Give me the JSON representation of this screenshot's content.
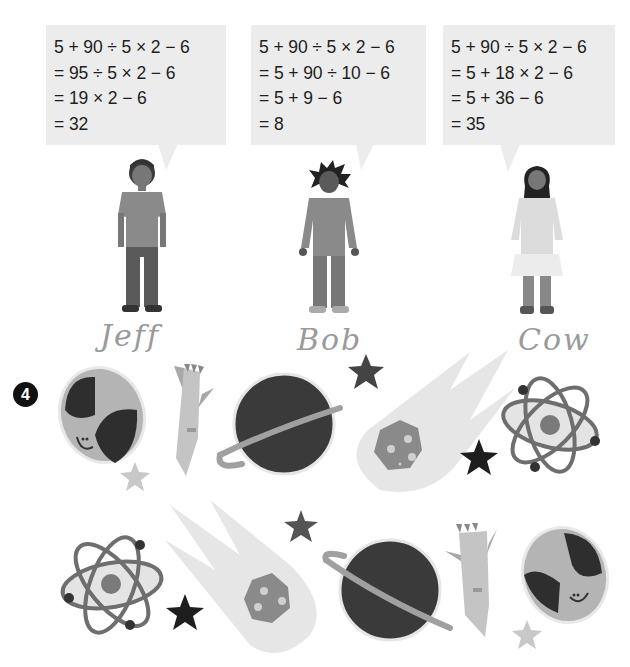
{
  "problem": {
    "expression": "5 + 90 ÷ 5 × 2 − 6"
  },
  "students": [
    {
      "name": "Jeff",
      "signature": "Jeff",
      "work": [
        "5 + 90 ÷ 5 × 2 − 6",
        "= 95 ÷ 5 × 2 − 6",
        "= 19 × 2 − 6",
        "= 32"
      ]
    },
    {
      "name": "Bob",
      "signature": "Bob",
      "work": [
        "5 + 90 ÷ 5 × 2 − 6",
        "= 5 + 90 ÷ 10 − 6",
        "= 5 + 9 − 6",
        "= 8"
      ]
    },
    {
      "name": "Cow",
      "signature": "Cow",
      "work": [
        "5 + 90 ÷ 5 × 2 − 6",
        "= 5 + 18 × 2 − 6",
        "= 5 + 36 − 6",
        "= 35"
      ]
    }
  ],
  "exercise": {
    "number": "4",
    "top_row": [
      "alien-head",
      "rocket",
      "saturn-planet",
      "comet",
      "atom"
    ],
    "bottom_row": [
      "atom",
      "comet",
      "saturn-planet",
      "rocket",
      "alien-head"
    ]
  },
  "colors": {
    "bubble": "#ececec",
    "text": "#1e1e1e",
    "dark": "#3a3a3a",
    "mid": "#8a8a8a",
    "light": "#c4c4c4",
    "pale": "#e4e4e4"
  }
}
